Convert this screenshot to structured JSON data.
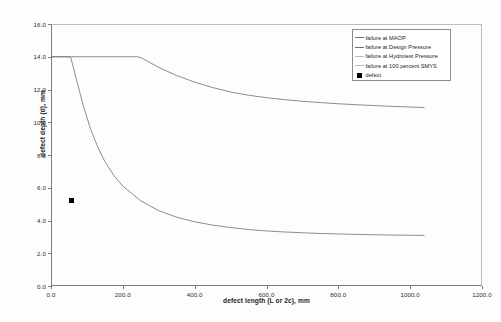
{
  "chart_data": {
    "type": "line",
    "title": "",
    "xlabel": "defect length (L or 2c), mm",
    "ylabel": "defect depth (d), mm",
    "xlim": [
      0.0,
      1200.0
    ],
    "ylim": [
      0.0,
      16.0
    ],
    "xticks": [
      "0.0",
      "200.0",
      "400.0",
      "600.0",
      "800.0",
      "1000.0",
      "1200.0"
    ],
    "xtick_values": [
      0,
      200,
      400,
      600,
      800,
      1000,
      1200
    ],
    "yticks": [
      "0.0",
      "2.0",
      "4.0",
      "6.0",
      "8.0",
      "10.0",
      "12.0",
      "14.0",
      "16.0"
    ],
    "ytick_values": [
      0,
      2,
      4,
      6,
      8,
      10,
      12,
      14,
      16
    ],
    "grid": false,
    "legend_position": "top-right",
    "series": [
      {
        "name": "failure at MAOP",
        "type": "line",
        "color": "#6e6e6e",
        "x": [
          0,
          50,
          100,
          150,
          200,
          240,
          250,
          300,
          350,
          400,
          450,
          500,
          550,
          600,
          650,
          700,
          750,
          800,
          850,
          900,
          950,
          1000,
          1040
        ],
        "y": [
          14.0,
          14.0,
          14.0,
          14.0,
          14.0,
          14.0,
          13.95,
          13.35,
          12.85,
          12.45,
          12.12,
          11.85,
          11.65,
          11.5,
          11.38,
          11.28,
          11.2,
          11.13,
          11.07,
          11.02,
          10.97,
          10.93,
          10.9
        ]
      },
      {
        "name": "failure at Design Pressure",
        "type": "line",
        "color": "#6e6e6e",
        "x": [
          0,
          50,
          55,
          70,
          90,
          110,
          130,
          150,
          175,
          200,
          250,
          300,
          350,
          400,
          450,
          500,
          550,
          600,
          650,
          700,
          750,
          800,
          850,
          900,
          950,
          1000,
          1040
        ],
        "y": [
          14.0,
          14.0,
          13.95,
          12.7,
          11.0,
          9.6,
          8.5,
          7.6,
          6.75,
          6.1,
          5.2,
          4.6,
          4.2,
          3.92,
          3.72,
          3.57,
          3.45,
          3.36,
          3.3,
          3.25,
          3.21,
          3.18,
          3.15,
          3.13,
          3.11,
          3.1,
          3.09
        ]
      },
      {
        "name": "failure at Hydrotest Pressure",
        "type": "line",
        "color": "#b8b8b8",
        "x": [],
        "y": []
      },
      {
        "name": "failure at 100 percent SMYS",
        "type": "line",
        "color": "#b8b8b8",
        "x": [],
        "y": []
      },
      {
        "name": "defect",
        "type": "scatter",
        "marker": "square",
        "color": "#000000",
        "x": [
          57
        ],
        "y": [
          5.25
        ]
      }
    ]
  },
  "legend": {
    "items": [
      {
        "label": "failure at MAOP",
        "marker": "line",
        "color": "#6e6e6e"
      },
      {
        "label": "failure at Design Pressure",
        "marker": "line",
        "color": "#6e6e6e"
      },
      {
        "label": "failure at Hydrotest Pressure",
        "marker": "line",
        "color": "#b8b8b8"
      },
      {
        "label": "failure at 100 percent SMYS",
        "marker": "line",
        "color": "#b8b8b8"
      },
      {
        "label": "defect",
        "marker": "square",
        "color": "#000000"
      }
    ]
  },
  "axes": {
    "x_title": "defect length (L or 2c), mm",
    "y_title": "defect depth (d), mm"
  }
}
